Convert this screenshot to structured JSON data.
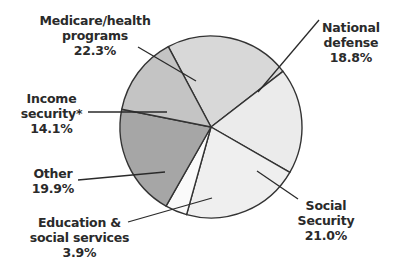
{
  "chart_data": {
    "type": "pie",
    "title": "",
    "center": [
      211,
      127
    ],
    "radius": 91,
    "start_angle_deg": -118,
    "slices": [
      {
        "name": "Medicare/health programs",
        "value": 22.3,
        "label": "22.3%",
        "color": "#d8d8d8"
      },
      {
        "name": "National defense",
        "value": 18.8,
        "label": "18.8%",
        "color": "#ebebeb"
      },
      {
        "name": "Social Security",
        "value": 21.0,
        "label": "21.0%",
        "color": "#efefef"
      },
      {
        "name": "Education & social services",
        "value": 3.9,
        "label": "3.9%",
        "color": "#fafafa"
      },
      {
        "name": "Other",
        "value": 19.9,
        "label": "19.9%",
        "color": "#a6a6a6"
      },
      {
        "name": "Income security*",
        "value": 14.1,
        "label": "14.1%",
        "color": "#c4c4c4"
      }
    ],
    "stroke_color": "#333333"
  },
  "labels": {
    "medicare": {
      "line1": "Medicare/health",
      "line2": "programs",
      "pct": "22.3%"
    },
    "defense": {
      "line1": "National",
      "line2": "defense",
      "pct": "18.8%"
    },
    "social_security": {
      "line1": "Social",
      "line2": "Security",
      "pct": "21.0%"
    },
    "education": {
      "line1": "Education &",
      "line2": "social services",
      "pct": "3.9%"
    },
    "other": {
      "line1": "Other",
      "pct": "19.9%"
    },
    "income": {
      "line1": "Income",
      "line2": "security*",
      "pct": "14.1%"
    }
  },
  "leaders": [
    {
      "from": [
        138,
        47
      ],
      "to": [
        196,
        81
      ]
    },
    {
      "from": [
        319,
        20
      ],
      "to": [
        258,
        92
      ]
    },
    {
      "from": [
        298,
        199
      ],
      "to": [
        257,
        171
      ]
    },
    {
      "from": [
        128,
        222
      ],
      "to": [
        212,
        198
      ]
    },
    {
      "from": [
        78,
        180
      ],
      "to": [
        165,
        172
      ]
    },
    {
      "from": [
        88,
        112
      ],
      "to": [
        167,
        112
      ]
    }
  ]
}
